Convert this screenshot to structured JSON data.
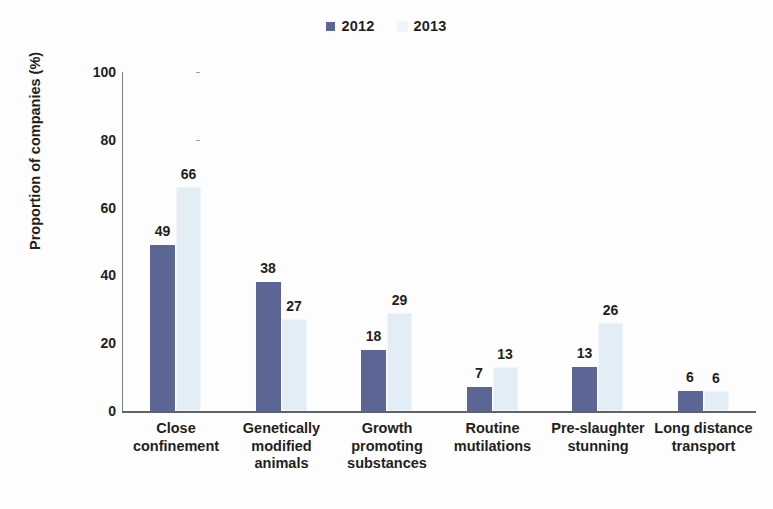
{
  "chart_data": {
    "type": "bar",
    "title": "",
    "subtitle": "",
    "xlabel": "",
    "ylabel": "Proportion of companies (%)",
    "ylim": [
      0,
      100
    ],
    "yticks": [
      0,
      20,
      40,
      60,
      80,
      100
    ],
    "grid": false,
    "legend_position": "top-center",
    "categories": [
      "Close confinement",
      "Genetically modified animals",
      "Growth promoting substances",
      "Routine mutilations",
      "Pre-slaughter stunning",
      "Long distance transport"
    ],
    "category_lines": [
      [
        "Close",
        "confinement"
      ],
      [
        "Genetically",
        "modified",
        "animals"
      ],
      [
        "Growth",
        "promoting",
        "substances"
      ],
      [
        "Routine",
        "mutilations"
      ],
      [
        "Pre-slaughter",
        "stunning"
      ],
      [
        "Long distance",
        "transport"
      ]
    ],
    "series": [
      {
        "name": "2012",
        "color": "#5b6695",
        "values": [
          49,
          38,
          18,
          7,
          13,
          6
        ]
      },
      {
        "name": "2013",
        "color": "#e3edf6",
        "values": [
          66,
          27,
          29,
          13,
          26,
          6
        ]
      }
    ]
  },
  "legend": {
    "entries": [
      {
        "label": "2012",
        "color": "#5b6695"
      },
      {
        "label": "2013",
        "color": "#eef4fa"
      }
    ]
  },
  "axes": {
    "y_title": "Proportion of companies (%)",
    "y_tick_labels": [
      "100",
      "80",
      "60",
      "40",
      "20",
      "0"
    ]
  }
}
